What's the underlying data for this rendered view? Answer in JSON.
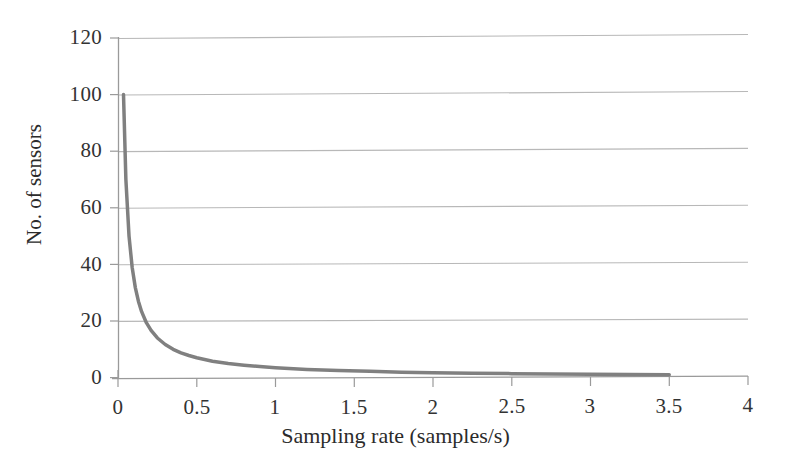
{
  "chart_data": {
    "type": "line",
    "title": "",
    "xlabel": "Sampling rate (samples/s)",
    "ylabel": "No. of sensors",
    "xlim": [
      0,
      4
    ],
    "ylim": [
      0,
      120
    ],
    "xticks": [
      "0",
      "0.5",
      "1",
      "1.5",
      "2",
      "2.5",
      "3",
      "3.5",
      "4"
    ],
    "xtick_values": [
      0,
      0.5,
      1,
      1.5,
      2,
      2.5,
      3,
      3.5,
      4
    ],
    "yticks": [
      "0",
      "20",
      "40",
      "60",
      "80",
      "100",
      "120"
    ],
    "ytick_values": [
      0,
      20,
      40,
      60,
      80,
      100,
      120
    ],
    "grid": "horizontal",
    "legend": "none",
    "series": [
      {
        "name": "No. of sensors vs sampling rate",
        "color": "#808080",
        "line_width": 3.5,
        "x": [
          0.035,
          0.05,
          0.07,
          0.09,
          0.11,
          0.13,
          0.15,
          0.18,
          0.21,
          0.25,
          0.3,
          0.35,
          0.4,
          0.45,
          0.5,
          0.6,
          0.7,
          0.8,
          0.9,
          1.0,
          1.2,
          1.4,
          1.6,
          1.8,
          2.0,
          2.25,
          2.5,
          2.75,
          3.0,
          3.25,
          3.5
        ],
        "y": [
          100,
          70,
          50,
          38.9,
          31.8,
          26.9,
          23.3,
          19.4,
          16.7,
          14.0,
          11.7,
          10.0,
          8.75,
          7.8,
          7.0,
          5.8,
          5.0,
          4.4,
          3.9,
          3.5,
          2.9,
          2.5,
          2.2,
          1.9,
          1.75,
          1.56,
          1.4,
          1.27,
          1.17,
          1.08,
          1.0
        ]
      }
    ]
  },
  "axes": {
    "axis_color": "#9a9a9a",
    "grid_color": "#b8b8b8",
    "tick_color": "#9a9a9a",
    "background": "#ffffff"
  }
}
